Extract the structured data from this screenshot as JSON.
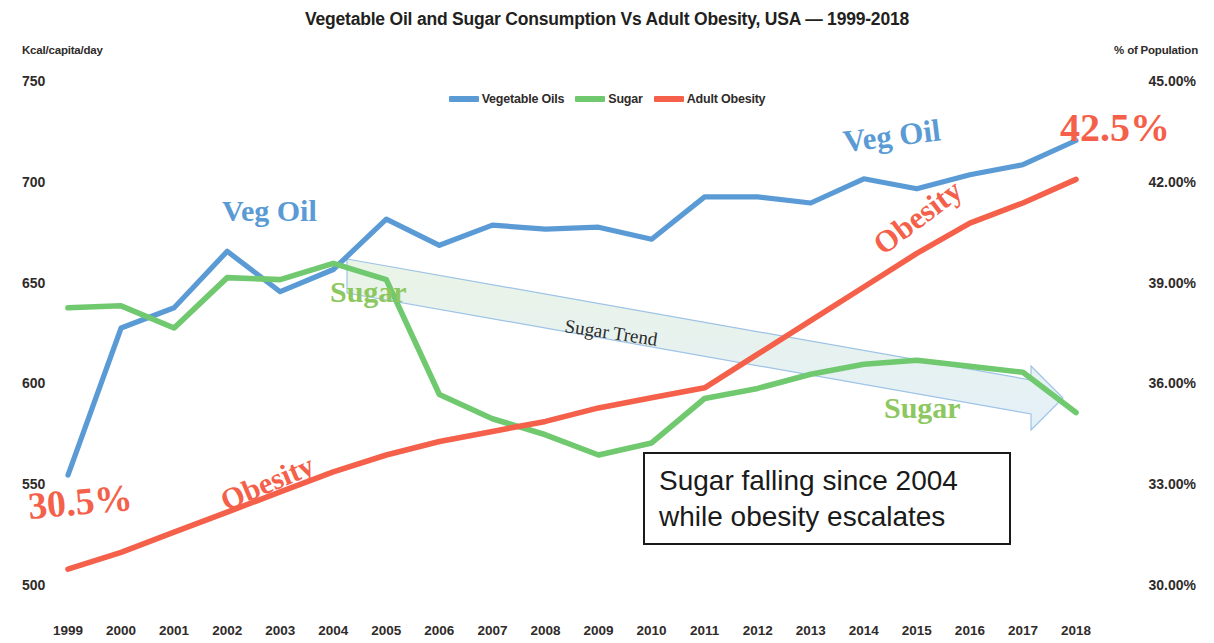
{
  "chart_data": {
    "type": "line",
    "title": "Vegetable Oil and Sugar Consumption Vs Adult Obesity, USA — 1999-2018",
    "xlabel": "",
    "ylabel": "Kcal/capita/day",
    "y2label": "% of Population",
    "grid": false,
    "legend_position": "top-center",
    "x": [
      1999,
      2000,
      2001,
      2002,
      2003,
      2004,
      2005,
      2006,
      2007,
      2008,
      2009,
      2010,
      2011,
      2012,
      2013,
      2014,
      2015,
      2016,
      2017,
      2018
    ],
    "categories": [
      "1999",
      "2000",
      "2001",
      "2002",
      "2003",
      "2004",
      "2005",
      "2006",
      "2007",
      "2008",
      "2009",
      "2010",
      "2011",
      "2012",
      "2013",
      "2014",
      "2015",
      "2016",
      "2017",
      "2018"
    ],
    "ylim": [
      500,
      750
    ],
    "yticks": [
      500,
      550,
      600,
      650,
      700,
      750
    ],
    "ytick_labels": [
      "500",
      "550",
      "600",
      "650",
      "700",
      "750"
    ],
    "y2lim": [
      30.0,
      45.0
    ],
    "y2ticks": [
      30.0,
      33.0,
      36.0,
      39.0,
      42.0,
      45.0
    ],
    "y2tick_labels": [
      "30.00%",
      "33.00%",
      "36.00%",
      "39.00%",
      "42.00%",
      "45.00%"
    ],
    "series": [
      {
        "name": "Vegetable Oils",
        "color": "#5b9bd5",
        "axis": "left",
        "unit": "Kcal/capita/day",
        "values": [
          555,
          628,
          638,
          666,
          646,
          657,
          682,
          669,
          679,
          677,
          678,
          672,
          693,
          693,
          690,
          702,
          697,
          704,
          709,
          721
        ]
      },
      {
        "name": "Sugar",
        "color": "#70c96f",
        "axis": "left",
        "unit": "Kcal/capita/day",
        "values": [
          638,
          639,
          628,
          653,
          652,
          660,
          652,
          595,
          583,
          575,
          565,
          571,
          593,
          598,
          605,
          610,
          612,
          609,
          606,
          586
        ]
      },
      {
        "name": "Adult Obesity",
        "color": "#f4604a",
        "axis": "right",
        "unit": "% of Population",
        "values": [
          30.5,
          31.0,
          31.6,
          32.2,
          32.8,
          33.4,
          33.9,
          34.3,
          34.6,
          34.9,
          35.3,
          35.6,
          35.9,
          36.9,
          37.9,
          38.9,
          39.9,
          40.8,
          41.4,
          42.1
        ]
      }
    ],
    "annotations": [
      {
        "name": "veg-oil-label-left",
        "text": "Veg Oil",
        "color": "#5b9bd5"
      },
      {
        "name": "veg-oil-label-right",
        "text": "Veg Oil",
        "color": "#5b9bd5"
      },
      {
        "name": "sugar-label-left",
        "text": "Sugar",
        "color": "#8dc760"
      },
      {
        "name": "sugar-label-right",
        "text": "Sugar",
        "color": "#8dc760"
      },
      {
        "name": "obesity-label-left",
        "text": "Obesity",
        "color": "#f4604a"
      },
      {
        "name": "obesity-label-right",
        "text": "Obesity",
        "color": "#f4604a"
      },
      {
        "name": "obesity-start-value",
        "text": "30.5%",
        "color": "#f4604a"
      },
      {
        "name": "obesity-end-value",
        "text": "42.5%",
        "color": "#f4604a"
      },
      {
        "name": "sugar-trend-arrow",
        "text": "Sugar Trend",
        "color": "#9dc3e6"
      },
      {
        "name": "callout-box",
        "text": "Sugar falling since 2004 while obesity escalates"
      }
    ]
  },
  "legend": {
    "items": [
      {
        "label": "Vegetable Oils",
        "color": "#5b9bd5"
      },
      {
        "label": "Sugar",
        "color": "#70c96f"
      },
      {
        "label": "Adult Obesity",
        "color": "#f4604a"
      }
    ]
  },
  "callout": {
    "line1": "Sugar falling since 2004",
    "line2": "while obesity escalates"
  },
  "trend": {
    "label": "Sugar Trend"
  },
  "labels": {
    "veg_oil": "Veg Oil",
    "sugar": "Sugar",
    "obesity": "Obesity",
    "pct_start": "30.5%",
    "pct_end": "42.5%"
  }
}
